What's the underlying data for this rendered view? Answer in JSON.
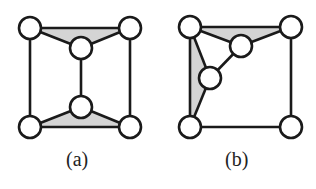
{
  "figures": [
    {
      "id": "a",
      "caption": "(a)",
      "nodes": [
        {
          "x": 30,
          "y": 28
        },
        {
          "x": 130,
          "y": 28
        },
        {
          "x": 81,
          "y": 48
        },
        {
          "x": 81,
          "y": 107
        },
        {
          "x": 30,
          "y": 127
        },
        {
          "x": 130,
          "y": 127
        }
      ],
      "edges": [
        [
          0,
          1
        ],
        [
          0,
          2
        ],
        [
          1,
          2
        ],
        [
          0,
          4
        ],
        [
          1,
          5
        ],
        [
          2,
          3
        ],
        [
          3,
          4
        ],
        [
          3,
          5
        ],
        [
          4,
          5
        ]
      ],
      "shaded": [
        [
          0,
          1,
          2
        ],
        [
          3,
          4,
          5
        ]
      ]
    },
    {
      "id": "b",
      "caption": "(b)",
      "nodes": [
        {
          "x": 190,
          "y": 27
        },
        {
          "x": 291,
          "y": 27
        },
        {
          "x": 241,
          "y": 46
        },
        {
          "x": 210,
          "y": 78
        },
        {
          "x": 190,
          "y": 127
        },
        {
          "x": 291,
          "y": 127
        }
      ],
      "edges": [
        [
          0,
          1
        ],
        [
          0,
          2
        ],
        [
          1,
          2
        ],
        [
          0,
          3
        ],
        [
          2,
          3
        ],
        [
          0,
          4
        ],
        [
          3,
          4
        ],
        [
          4,
          5
        ],
        [
          1,
          5
        ]
      ],
      "shaded": [
        [
          0,
          1,
          2
        ],
        [
          0,
          3,
          4
        ]
      ]
    }
  ],
  "style": {
    "stroke": "#1a1a1a",
    "fill_shade": "#d4d4d4",
    "node_fill": "#ffffff",
    "node_radius": 11
  }
}
